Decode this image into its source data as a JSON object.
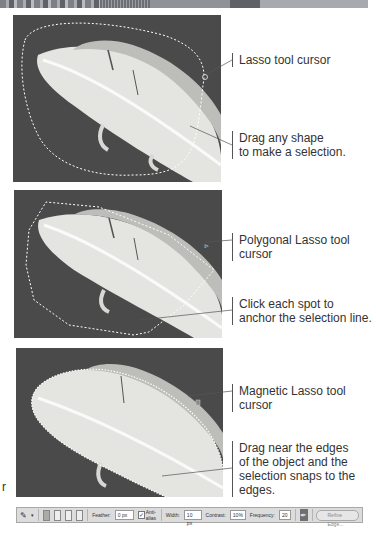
{
  "panels": [
    {
      "tool": "Lasso",
      "cursor_label": "Lasso tool cursor",
      "instruction_lines": [
        "Drag any shape",
        "to make a selection."
      ]
    },
    {
      "tool": "Polygonal Lasso",
      "cursor_label": "Polygonal Lasso tool cursor",
      "instruction_lines": [
        "Click each spot to",
        "anchor the selection line."
      ]
    },
    {
      "tool": "Magnetic Lasso",
      "cursor_label": "Magnetic Lasso tool cursor",
      "instruction_lines": [
        "Drag near the edges",
        "of the object and the",
        "selection snaps to the edges."
      ]
    }
  ],
  "stray_text": "r",
  "options_bar": {
    "tool_icon": "magnetic-lasso-icon",
    "selection_modes": [
      "new",
      "add",
      "subtract",
      "intersect"
    ],
    "feather_label": "Feather:",
    "feather_value": "0 px",
    "anti_alias_label": "Anti-alias",
    "anti_alias_checked": true,
    "width_label": "Width:",
    "width_value": "10 px",
    "contrast_label": "Contrast:",
    "contrast_value": "10%",
    "frequency_label": "Frequency:",
    "frequency_value": "20",
    "pen_pressure_icon": "stylus-pressure-icon",
    "refine_edge_label": "Refine Edge..."
  },
  "colors": {
    "photo_background": "#4a4a4a",
    "feather": "#e6e6e2",
    "callout_text": "#333333",
    "toolbar_bg": "#dcdcdc"
  }
}
